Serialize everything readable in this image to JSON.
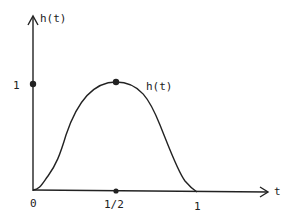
{
  "diagram": {
    "y_axis_label": "h(t)",
    "x_axis_label": "t",
    "y_tick_label": "1",
    "curve_label": "h(t)",
    "x_tick_labels": [
      "0",
      "1/2",
      "1"
    ],
    "stroke_color": "#222222",
    "points": [
      {
        "name": "y-unit",
        "t": 0,
        "h": 1
      },
      {
        "name": "peak",
        "t": 0.5,
        "h": 1
      },
      {
        "name": "x-half",
        "t": 0.5,
        "h": 0
      }
    ]
  }
}
